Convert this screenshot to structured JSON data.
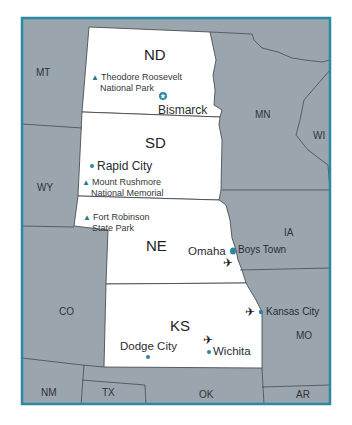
{
  "map": {
    "colors": {
      "frame": "#2a8aa3",
      "other_state_fill": "#9ba5ad",
      "highlight_state_fill": "#ffffff",
      "border_line": "#3a3f44",
      "marker": "#2a87a2"
    },
    "highlighted_states": [
      {
        "abbr": "ND"
      },
      {
        "abbr": "SD"
      },
      {
        "abbr": "NE"
      },
      {
        "abbr": "KS"
      }
    ],
    "neighbor_states": [
      {
        "abbr": "MT"
      },
      {
        "abbr": "WY"
      },
      {
        "abbr": "CO"
      },
      {
        "abbr": "MN"
      },
      {
        "abbr": "WI"
      },
      {
        "abbr": "IA"
      },
      {
        "abbr": "MO"
      },
      {
        "abbr": "NM"
      },
      {
        "abbr": "TX"
      },
      {
        "abbr": "OK"
      },
      {
        "abbr": "AR"
      }
    ],
    "cities": [
      {
        "name": "Bismarck",
        "type": "capital-star"
      },
      {
        "name": "Rapid City",
        "type": "dot"
      },
      {
        "name": "Omaha",
        "type": "dot"
      },
      {
        "name": "Boys Town",
        "type": "dot"
      },
      {
        "name": "Kansas City",
        "type": "dot"
      },
      {
        "name": "Dodge City",
        "type": "dot"
      },
      {
        "name": "Wichita",
        "type": "dot"
      }
    ],
    "parks": [
      {
        "line1": "Theodore Roosevelt",
        "line2": "National Park"
      },
      {
        "line1": "Mount Rushmore",
        "line2": "National Memorial"
      },
      {
        "line1": "Fort Robinson",
        "line2": "State Park"
      }
    ],
    "airports": [
      {
        "near": "Omaha"
      },
      {
        "near": "Kansas City"
      },
      {
        "near": "Wichita"
      }
    ],
    "symbols": {
      "park": "▲",
      "airport": "✈"
    }
  }
}
